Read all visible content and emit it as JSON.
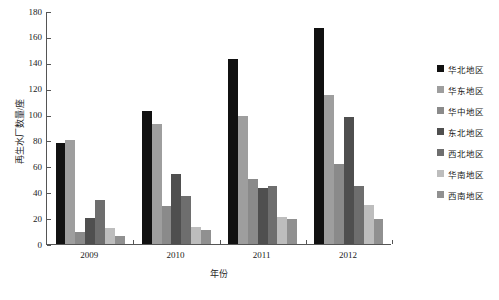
{
  "chart_data": {
    "type": "bar",
    "title": "",
    "subtitle": "",
    "xlabel": "年份",
    "ylabel": "再生水厂数量/座",
    "categories": [
      "2009",
      "2010",
      "2011",
      "2012"
    ],
    "ylim": [
      0,
      180
    ],
    "yticks": [
      0,
      20,
      40,
      60,
      80,
      100,
      120,
      140,
      160,
      180
    ],
    "ytick_labels": [
      "0",
      "20",
      "40",
      "60",
      "80",
      "100",
      "120",
      "140",
      "160",
      "180"
    ],
    "grid": false,
    "legend_position": "right",
    "series": [
      {
        "name": "华北地区",
        "color": "#111111",
        "values": [
          78,
          103,
          143,
          167
        ]
      },
      {
        "name": "华东地区",
        "color": "#9e9e9e",
        "values": [
          80,
          93,
          99,
          115
        ]
      },
      {
        "name": "华中地区",
        "color": "#8a8a8a",
        "values": [
          9,
          29,
          50,
          62
        ]
      },
      {
        "name": "东北地区",
        "color": "#4f4f4f",
        "values": [
          20,
          54,
          43,
          98
        ]
      },
      {
        "name": "西北地区",
        "color": "#6e6e6e",
        "values": [
          34,
          37,
          45,
          45
        ]
      },
      {
        "name": "华南地区",
        "color": "#bdbdbd",
        "values": [
          12,
          13,
          21,
          30
        ]
      },
      {
        "name": "西南地区",
        "color": "#909090",
        "values": [
          6,
          11,
          19,
          19
        ]
      }
    ]
  },
  "legend": {
    "items": [
      {
        "label": "华北地区",
        "color": "#111111"
      },
      {
        "label": "华东地区",
        "color": "#9e9e9e"
      },
      {
        "label": "华中地区",
        "color": "#8a8a8a"
      },
      {
        "label": "东北地区",
        "color": "#4f4f4f"
      },
      {
        "label": "西北地区",
        "color": "#6e6e6e"
      },
      {
        "label": "华南地区",
        "color": "#bdbdbd"
      },
      {
        "label": "西南地区",
        "color": "#909090"
      }
    ]
  }
}
